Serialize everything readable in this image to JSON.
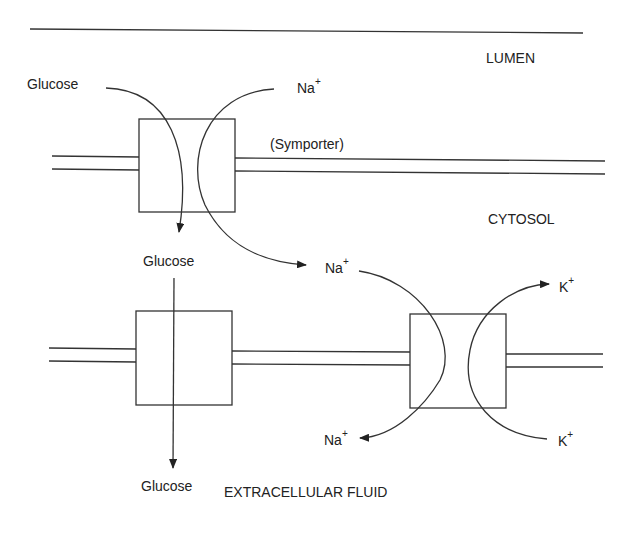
{
  "diagram": {
    "regions": {
      "lumen": "LUMEN",
      "cytosol": "CYTOSOL",
      "extracellular": "EXTRACELLULAR FLUID"
    },
    "transporters": {
      "symporter": "(Symporter)"
    },
    "labels": {
      "glucose_lumen": "Glucose",
      "na_lumen": "Na",
      "glucose_cytosol": "Glucose",
      "na_cytosol": "Na",
      "k_cytosol": "K",
      "glucose_ecf": "Glucose",
      "na_ecf": "Na",
      "k_ecf": "K",
      "plus": "+"
    },
    "stroke_color": "#333333"
  }
}
